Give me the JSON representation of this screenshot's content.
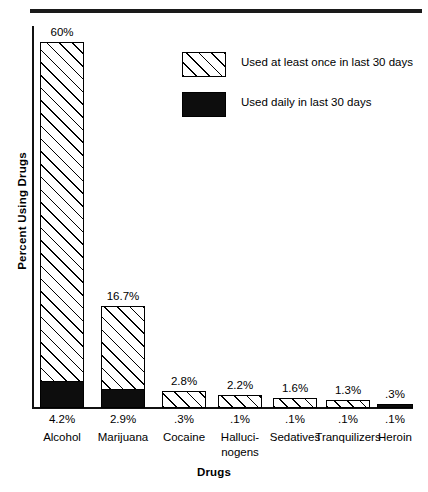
{
  "chart_data": {
    "type": "bar",
    "title": "",
    "xlabel": "Drugs",
    "ylabel": "Percent Using Drugs",
    "ylim": [
      0,
      62
    ],
    "grid": false,
    "legend_position": "upper-right",
    "categories": [
      "Alcohol",
      "Marijuana",
      "Cocaine",
      "Hallucinogens",
      "Sedatives",
      "Tranquilizers",
      "Heroin"
    ],
    "category_labels": [
      [
        "Alcohol"
      ],
      [
        "Marijuana"
      ],
      [
        "Cocaine"
      ],
      [
        "Halluci-",
        "nogens"
      ],
      [
        "Sedatives"
      ],
      [
        "Tranquilizers"
      ],
      [
        "Heroin"
      ]
    ],
    "series": [
      {
        "name": "Used at least once in last 30 days",
        "style": "hatched",
        "values": [
          60,
          16.7,
          2.8,
          2.2,
          1.6,
          1.3,
          0.3
        ],
        "value_labels": [
          "60%",
          "16.7%",
          "2.8%",
          "2.2%",
          "1.6%",
          "1.3%",
          ".3%"
        ]
      },
      {
        "name": "Used daily in last 30 days",
        "style": "solid-black",
        "values": [
          4.2,
          2.9,
          0.3,
          0.1,
          0.1,
          0.1,
          0.1
        ],
        "value_labels": [
          "4.2%",
          "2.9%",
          ".3%",
          ".1%",
          ".1%",
          ".1%",
          ".1%"
        ]
      }
    ]
  },
  "legend": {
    "items": [
      {
        "label": "Used at least once in last 30 days",
        "swatch": "hatched"
      },
      {
        "label": "Used daily in last 30 days",
        "swatch": "solid-black"
      }
    ]
  },
  "axis": {
    "y_title": "Percent Using Drugs",
    "x_title": "Drugs"
  }
}
